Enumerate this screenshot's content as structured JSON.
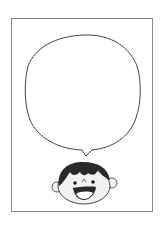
{
  "illustration": {
    "title": "",
    "frame": {
      "border_color": "#8a8a8a",
      "background": "#ffffff"
    },
    "speech_bubble": {
      "text": "",
      "stroke_color": "#444444",
      "fill": "#ffffff"
    },
    "character": {
      "description": "smiling cartoon boy face",
      "hair_color": "#2a2a2a",
      "skin_color": "#f2f2f2",
      "mouth_color": "#2a2a2a",
      "tongue_color": "#ffffff"
    }
  }
}
